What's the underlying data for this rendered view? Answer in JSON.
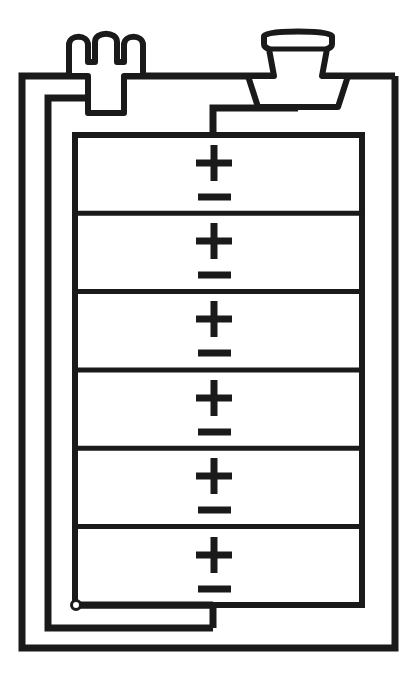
{
  "diagram": {
    "title": "9V Battery Internal Cell Schematic",
    "type": "line-art-schematic",
    "canvas": {
      "width": 417,
      "height": 675
    },
    "stroke_color": "#1a1a1a",
    "fill_color": "#ffffff",
    "background_color": "#ffffff",
    "terminals": [
      {
        "id": "terminal-female-snap",
        "name": "female-snap-terminal",
        "side": "left",
        "shape": "crown",
        "center_x": 106,
        "top_y": 30
      },
      {
        "id": "terminal-male-snap",
        "name": "male-snap-terminal",
        "side": "right",
        "shape": "button",
        "center_x": 298,
        "top_y": 30
      }
    ],
    "casing": {
      "name": "battery-outer-casing",
      "outer": {
        "x": 22,
        "y": 76,
        "width": 373,
        "height": 572
      },
      "inner": {
        "x": 48,
        "y": 98,
        "width": 332,
        "height": 530
      }
    },
    "cell_stack": {
      "name": "cell-stack",
      "x": 75,
      "y": 135,
      "width": 287,
      "height": 470,
      "cell_count": 6,
      "cells": [
        {
          "index": 1,
          "plus": "+",
          "minus": "–"
        },
        {
          "index": 2,
          "plus": "+",
          "minus": "–"
        },
        {
          "index": 3,
          "plus": "+",
          "minus": "–"
        },
        {
          "index": 4,
          "plus": "+",
          "minus": "–"
        },
        {
          "index": 5,
          "plus": "+",
          "minus": "–"
        },
        {
          "index": 6,
          "plus": "+",
          "minus": "–"
        }
      ]
    },
    "node": {
      "name": "connection-node",
      "cx": 76,
      "cy": 605,
      "r": 4
    },
    "wires": [
      {
        "name": "wire-positive-to-stack-top",
        "from": "male-snap-terminal",
        "to": "cell-stack-top"
      },
      {
        "name": "wire-negative-to-casing",
        "from": "female-snap-terminal",
        "to": "casing-inner-left"
      },
      {
        "name": "wire-stack-bottom-return",
        "from": "connection-node",
        "to": "casing-inner-bottom"
      }
    ]
  }
}
